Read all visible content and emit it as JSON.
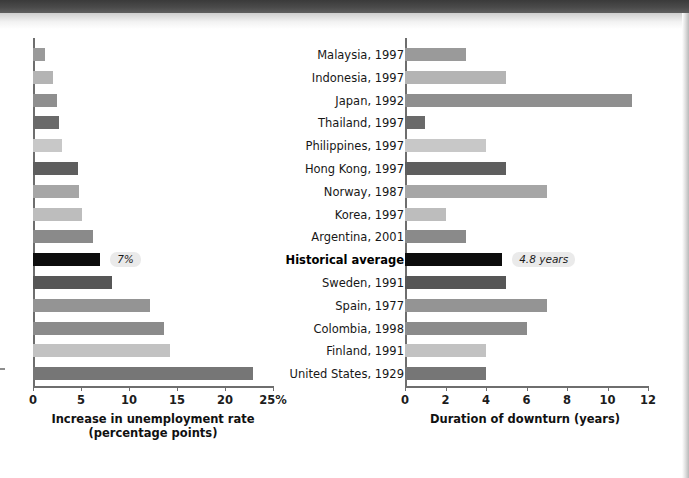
{
  "figure": {
    "kind": "paired-horizontal-bar-chart",
    "highlight_row": "Historical average"
  },
  "categories": [
    "Malaysia, 1997",
    "Indonesia, 1997",
    "Japan, 1992",
    "Thailand, 1997",
    "Philippines, 1997",
    "Hong Kong, 1997",
    "Norway, 1987",
    "Korea, 1997",
    "Argentina, 2001",
    "Historical average",
    "Sweden, 1991",
    "Spain, 1977",
    "Colombia, 1998",
    "Finland, 1991",
    "United States, 1929"
  ],
  "left": {
    "axis_title_line1": "Increase in unemployment rate",
    "axis_title_line2": "(percentage points)",
    "ticks": [
      "0",
      "5",
      "10",
      "15",
      "20",
      "25%"
    ],
    "tick_values": [
      0,
      5,
      10,
      15,
      20,
      25
    ],
    "badge": "7%"
  },
  "right": {
    "axis_title_line1": "Duration of downturn (years)",
    "axis_title_line2": "",
    "ticks": [
      "0",
      "2",
      "4",
      "6",
      "8",
      "10",
      "12"
    ],
    "tick_values": [
      0,
      2,
      4,
      6,
      8,
      10,
      12
    ],
    "badge": "4.8 years"
  },
  "bar_colors": [
    "#9a9a9a",
    "#b4b4b4",
    "#8f8f8f",
    "#6a6a6a",
    "#c8c8c8",
    "#5e5e5e",
    "#a6a6a6",
    "#bdbdbd",
    "#8a8a8a",
    "#0d0d0d",
    "#565656",
    "#949494",
    "#8b8b8b",
    "#c2c2c2",
    "#767676"
  ],
  "chart_data": [
    {
      "type": "bar",
      "orientation": "horizontal",
      "title": "",
      "xlabel": "Increase in unemployment rate (percentage points)",
      "ylabel": "",
      "xlim": [
        0,
        25
      ],
      "grid": false,
      "legend": "none",
      "categories": [
        "Malaysia, 1997",
        "Indonesia, 1997",
        "Japan, 1992",
        "Thailand, 1997",
        "Philippines, 1997",
        "Hong Kong, 1997",
        "Norway, 1987",
        "Korea, 1997",
        "Argentina, 2001",
        "Historical average",
        "Sweden, 1991",
        "Spain, 1977",
        "Colombia, 1998",
        "Finland, 1991",
        "United States, 1929"
      ],
      "values": [
        1.2,
        2.1,
        2.5,
        2.7,
        3.0,
        4.7,
        4.8,
        5.1,
        6.3,
        7.0,
        8.2,
        12.2,
        13.6,
        14.3,
        22.9
      ],
      "annotations": [
        {
          "category": "Historical average",
          "text": "7%"
        }
      ]
    },
    {
      "type": "bar",
      "orientation": "horizontal",
      "title": "",
      "xlabel": "Duration of downturn (years)",
      "ylabel": "",
      "xlim": [
        0,
        12
      ],
      "grid": false,
      "legend": "none",
      "categories": [
        "Malaysia, 1997",
        "Indonesia, 1997",
        "Japan, 1992",
        "Thailand, 1997",
        "Philippines, 1997",
        "Hong Kong, 1997",
        "Norway, 1987",
        "Korea, 1997",
        "Argentina, 2001",
        "Historical average",
        "Sweden, 1991",
        "Spain, 1977",
        "Colombia, 1998",
        "Finland, 1991",
        "United States, 1929"
      ],
      "values": [
        3.0,
        5.0,
        11.2,
        1.0,
        4.0,
        5.0,
        7.0,
        2.0,
        3.0,
        4.8,
        5.0,
        7.0,
        6.0,
        4.0,
        4.0
      ],
      "annotations": [
        {
          "category": "Historical average",
          "text": "4.8 years"
        }
      ]
    }
  ]
}
